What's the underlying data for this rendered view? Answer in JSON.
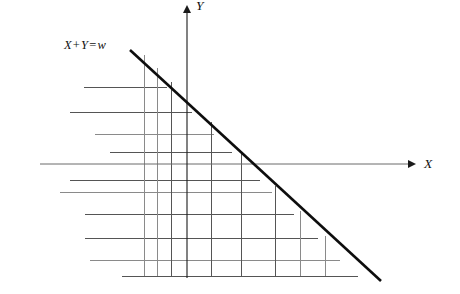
{
  "figure": {
    "background_color": "#ffffff",
    "width": 460,
    "height": 294
  },
  "axes": {
    "x": {
      "label": "X",
      "name": "x-axis",
      "y_position": 164,
      "x_start": 40,
      "x_end": 408,
      "arrow": true,
      "color": "#6b6b6b"
    },
    "y": {
      "label": "Y",
      "name": "y-axis",
      "x_position": 187,
      "y_start": 13,
      "y_end": 278,
      "arrow": true,
      "color": "#1a1a1a"
    }
  },
  "constraint": {
    "label_parts": {
      "x": "X",
      "plus": "+",
      "y": "Y",
      "equals": "=",
      "w": "w"
    },
    "label_full": "X + Y = w",
    "color": "#0d0d0d",
    "x1": 130,
    "y1": 50,
    "x2": 381,
    "y2": 281,
    "slope": -1
  },
  "chart_data": {
    "type": "line",
    "xlabel": "X",
    "ylabel": "Y",
    "grid": true,
    "legend": "none",
    "constraint_line": {
      "equation": "X + Y = w",
      "endpoints": [
        [
          130,
          50
        ],
        [
          381,
          281
        ]
      ]
    },
    "vertical_lines": [
      {
        "x": 144,
        "y_top": 55,
        "y_bottom": 276,
        "weight": "faint"
      },
      {
        "x": 157,
        "y_top": 68,
        "y_bottom": 276,
        "weight": "faint"
      },
      {
        "x": 171,
        "y_top": 82,
        "y_bottom": 276,
        "weight": "normal"
      },
      {
        "x": 187,
        "y_top": 13,
        "y_bottom": 278,
        "weight": "axis"
      },
      {
        "x": 211,
        "y_top": 122,
        "y_bottom": 276,
        "weight": "normal"
      },
      {
        "x": 241,
        "y_top": 152,
        "y_bottom": 276,
        "weight": "normal"
      },
      {
        "x": 275,
        "y_top": 186,
        "y_bottom": 276,
        "weight": "normal"
      },
      {
        "x": 300,
        "y_top": 211,
        "y_bottom": 276,
        "weight": "faint"
      },
      {
        "x": 325,
        "y_top": 236,
        "y_bottom": 276,
        "weight": "faint"
      }
    ],
    "horizontal_lines": [
      {
        "y": 87,
        "x_start": 84,
        "x_end": 167,
        "weight": "normal"
      },
      {
        "y": 112,
        "x_start": 70,
        "x_end": 192,
        "weight": "normal"
      },
      {
        "y": 134,
        "x_start": 95,
        "x_end": 214,
        "weight": "faint"
      },
      {
        "y": 152,
        "x_start": 110,
        "x_end": 232,
        "weight": "normal"
      },
      {
        "y": 164,
        "x_start": 40,
        "x_end": 408,
        "weight": "axis"
      },
      {
        "y": 180,
        "x_start": 70,
        "x_end": 260,
        "weight": "normal"
      },
      {
        "y": 192,
        "x_start": 60,
        "x_end": 272,
        "weight": "faint"
      },
      {
        "y": 214,
        "x_start": 85,
        "x_end": 294,
        "weight": "normal"
      },
      {
        "y": 238,
        "x_start": 85,
        "x_end": 318,
        "weight": "normal"
      },
      {
        "y": 260,
        "x_start": 90,
        "x_end": 340,
        "weight": "faint"
      },
      {
        "y": 276,
        "x_start": 122,
        "x_end": 358,
        "weight": "normal"
      }
    ]
  }
}
